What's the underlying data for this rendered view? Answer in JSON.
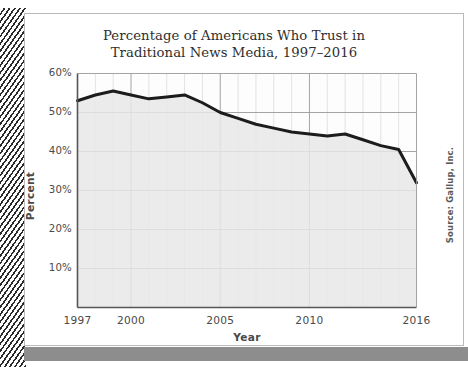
{
  "figure": {
    "source_note": "Source: Gallup, Inc.",
    "frame_color": "#b9b9b9",
    "footer_bar_color": "#8d8d8d",
    "binding_color": "#2b2b2b"
  },
  "chart_data": {
    "type": "line",
    "title": "Percentage of Americans Who Trust in\nTraditional News Media, 1997–2016",
    "xlabel": "Year",
    "ylabel": "Percent",
    "x": [
      1997,
      1998,
      1999,
      2000,
      2001,
      2002,
      2003,
      2004,
      2005,
      2006,
      2007,
      2008,
      2009,
      2010,
      2011,
      2012,
      2013,
      2014,
      2015,
      2016
    ],
    "values": [
      53,
      54.5,
      55.5,
      54.5,
      53.5,
      54,
      54.5,
      52.5,
      50,
      48.5,
      47,
      46,
      45,
      44.5,
      44,
      44.5,
      43,
      41.5,
      40.5,
      32
    ],
    "series": [
      {
        "name": "Trust in Traditional News Media",
        "values": [
          53,
          54.5,
          55.5,
          54.5,
          53.5,
          54,
          54.5,
          52.5,
          50,
          48.5,
          47,
          46,
          45,
          44.5,
          44,
          44.5,
          43,
          41.5,
          40.5,
          32
        ]
      }
    ],
    "xlim": [
      1997,
      2016
    ],
    "ylim": [
      0,
      60
    ],
    "xticks": [
      1997,
      2000,
      2005,
      2010,
      2016
    ],
    "xtick_labels": [
      "1997",
      "2000",
      "2005",
      "2010",
      "2016"
    ],
    "yticks": [
      10,
      20,
      30,
      40,
      50,
      60
    ],
    "ytick_labels": [
      "10%",
      "20%",
      "30%",
      "40%",
      "50%",
      "60%"
    ],
    "grid": true,
    "grid_minor": true,
    "legend": "none",
    "line_color": "#1c1c1c",
    "line_width": 3,
    "fill_color": "#e8e8e8",
    "plot_background": "#fdfdfd",
    "gridline_color": "#9a9a9a",
    "minor_gridline_color": "#dcdcdc",
    "annotations": []
  }
}
